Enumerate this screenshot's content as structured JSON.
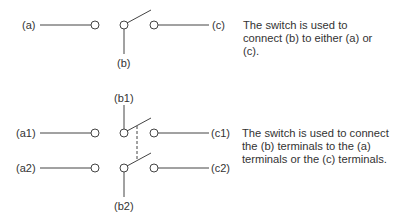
{
  "diagram1": {
    "labels": {
      "a": "(a)",
      "b": "(b)",
      "c": "(c)"
    },
    "description": "The switch is used to connect (b) to either (a) or (c)."
  },
  "diagram2": {
    "labels": {
      "a1": "(a1)",
      "a2": "(a2)",
      "b1": "(b1)",
      "b2": "(b2)",
      "c1": "(c1)",
      "c2": "(c2)"
    },
    "description": "The switch is used to connect the (b) terminals to the (a) terminals or the (c) terminals."
  },
  "colors": {
    "line": "#444444",
    "text": "#333333"
  }
}
